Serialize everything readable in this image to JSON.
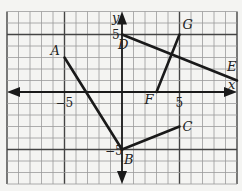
{
  "graph": {
    "x_axis_label": "x",
    "y_axis_label": "y",
    "x_range": [
      -10,
      10
    ],
    "y_range": [
      -8,
      7
    ],
    "tick_labels": {
      "x_neg": "−5",
      "x_pos": "5",
      "y_pos": "5",
      "y_neg": "−5"
    },
    "points": [
      {
        "name": "A",
        "x": -5,
        "y": 3
      },
      {
        "name": "B",
        "x": 0,
        "y": -5
      },
      {
        "name": "C",
        "x": 5,
        "y": -3
      },
      {
        "name": "D",
        "x": 0,
        "y": 5
      },
      {
        "name": "E",
        "x": 10,
        "y": 1
      },
      {
        "name": "F",
        "x": 3,
        "y": 0
      },
      {
        "name": "G",
        "x": 5,
        "y": 5
      }
    ],
    "segments": [
      {
        "from": "A",
        "to": "B"
      },
      {
        "from": "B",
        "to": "C"
      },
      {
        "from": "D",
        "to": "E"
      },
      {
        "from": "F",
        "to": "G"
      }
    ],
    "colors": {
      "grid": "#9a9a9a",
      "grid_major": "#444444",
      "axis": "#1a1a1a",
      "segment": "#1a1a1a",
      "background": "#f4f4f2"
    }
  }
}
